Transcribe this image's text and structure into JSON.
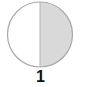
{
  "figure": {
    "type": "half-shaded-circle",
    "shaded_fraction": "1/2",
    "shaded_side": "right",
    "label": "1",
    "colors": {
      "fill_shaded": "#d9d9d9",
      "fill_unshaded": "#ffffff",
      "stroke": "#a8a8a8",
      "label": "#111111"
    }
  }
}
